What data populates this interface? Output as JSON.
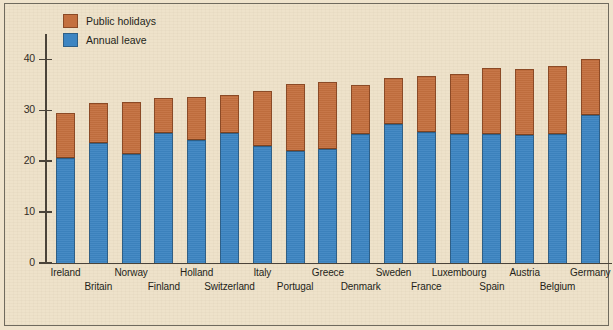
{
  "chart_data": {
    "type": "bar",
    "stacked": true,
    "title": "",
    "xlabel": "",
    "ylabel": "",
    "ylim": [
      0,
      45
    ],
    "yticks": [
      0,
      10,
      20,
      30,
      40
    ],
    "grid": false,
    "legend_position": "top-left",
    "categories": [
      "Ireland",
      "Britain",
      "Norway",
      "Finland",
      "Holland",
      "Switzerland",
      "Italy",
      "Portugal",
      "Greece",
      "Denmark",
      "Sweden",
      "France",
      "Luxembourg",
      "Spain",
      "Austria",
      "Belgium",
      "Germany"
    ],
    "series": [
      {
        "name": "Annual leave",
        "color": "#3d85c2",
        "values": [
          20.5,
          23.5,
          21.3,
          25.4,
          24.0,
          25.4,
          22.8,
          22.0,
          22.3,
          25.2,
          27.3,
          25.6,
          25.2,
          25.2,
          25.1,
          25.2,
          29.0
        ]
      },
      {
        "name": "Public holidays",
        "color": "#c4703f",
        "values": [
          8.9,
          7.8,
          10.3,
          7.0,
          8.5,
          7.6,
          10.9,
          13.0,
          13.2,
          9.7,
          8.9,
          11.1,
          11.8,
          13.0,
          13.0,
          13.4,
          11.0
        ]
      }
    ],
    "totals": [
      29.4,
      31.3,
      31.6,
      32.4,
      32.5,
      33.0,
      33.7,
      35.0,
      35.5,
      34.9,
      36.2,
      36.7,
      37.0,
      38.2,
      38.1,
      38.6,
      40.0
    ]
  },
  "legend": {
    "items": [
      {
        "label": "Public holidays",
        "color": "#c4703f"
      },
      {
        "label": "Annual leave",
        "color": "#3d85c2"
      }
    ]
  },
  "axis": {
    "y_tick_labels": [
      "40",
      "30",
      "20",
      "10",
      "0"
    ]
  }
}
